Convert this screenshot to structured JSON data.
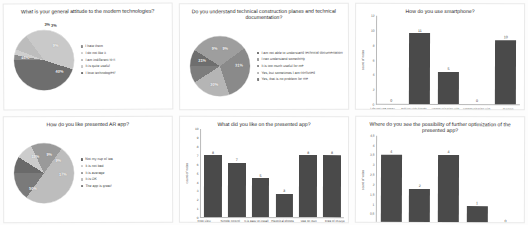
{
  "charts": [
    {
      "id": "attitude-pie",
      "title": "What is your general  attitude to the modern technologies?",
      "type": "pie",
      "labels": [
        "I hate them",
        "I do not like it",
        "I am indifferent to it",
        "It is quite useful",
        "I love technologies!"
      ],
      "values": [
        3,
        3,
        9,
        40,
        45
      ],
      "value_labels": [
        "3%",
        "3%",
        "9%",
        "40%",
        "45%"
      ],
      "colors": [
        "#8c8c8c",
        "#cfcfcf",
        "#bdbdbd",
        "#c9c9c9",
        "#6e6e6e"
      ]
    },
    {
      "id": "understand-pie",
      "title": "Do you understand technical construction planes and technical documentation?",
      "type": "pie",
      "labels": [
        "I am not able to understand technical documentation",
        "I can understand something",
        "It is too much useful for me",
        "Yes, but sometimes I am confused",
        "Yes, that is no problem for me"
      ],
      "values": [
        9,
        31,
        30,
        21,
        9
      ],
      "value_labels": [
        "9%",
        "31%",
        "30%",
        "21%",
        "9%"
      ],
      "colors": [
        "#6e6e6e",
        "#9e9e9e",
        "#8a8a8a",
        "#b5b5b5",
        "#7d7d7d"
      ]
    },
    {
      "id": "smartphone-bar",
      "title": "How do you use smartphone?",
      "type": "bar",
      "ylabel": "count of votes",
      "yticks": [
        "12",
        "10",
        "8",
        "6",
        "4",
        "2",
        "0"
      ],
      "ymax": 12,
      "categories": [
        "I do not use smart functions in smartphone at all",
        "Talking with friends and family, social networks",
        "Communication with bank/insurance company",
        "Communication with public authorities",
        "Gaming"
      ],
      "values": [
        0,
        11,
        5,
        0,
        10
      ],
      "value_labels": [
        "0",
        "11",
        "5",
        "0",
        "10"
      ]
    },
    {
      "id": "like-ar-pie",
      "title": "How do you like presented AR app?",
      "type": "pie",
      "labels": [
        "Not my cup of tea",
        "It is not bad",
        "It is average",
        "It is OK",
        "The app is great!"
      ],
      "values": [
        9,
        9,
        17,
        50,
        15
      ],
      "value_labels": [
        "9%",
        "9%",
        "17%",
        "50%",
        "15%"
      ],
      "colors": [
        "#6a6a6a",
        "#cccccc",
        "#9a9a9a",
        "#bdbdbd",
        "#7a7a7a"
      ]
    },
    {
      "id": "liked-bar",
      "title": "What did you like on the presented app?",
      "type": "bar",
      "ylabel": "count of votes",
      "yticks": [
        "10",
        "9",
        "8",
        "7",
        "6",
        "5",
        "4",
        "3",
        "2",
        "1",
        "0"
      ],
      "ymax": 10,
      "categories": [
        "Free view",
        "Simple control",
        "It is easy to install",
        "Historical photos",
        "Use on own mobile phone",
        "Free of charge"
      ],
      "values": [
        8,
        7,
        5,
        3,
        8,
        8
      ],
      "value_labels": [
        "8",
        "7",
        "5",
        "3",
        "8",
        "8"
      ]
    },
    {
      "id": "optimization-bar",
      "title": "Where do you see the possibility of further optimization of the presented app?",
      "type": "bar",
      "ylabel": "count of votes",
      "yticks": [
        "4,5",
        "4",
        "3,5",
        "3",
        "2,5",
        "2",
        "1,5",
        "1",
        "0,5",
        "0"
      ],
      "ymax": 4.5,
      "categories": [
        "Use it for urban planning visualisation",
        "Use it to work on construction processes",
        "Add more historical photos and places",
        "Make the application handsfree",
        "Make a PC version of the app"
      ],
      "values": [
        4,
        2,
        4,
        1,
        0
      ],
      "value_labels": [
        "4",
        "2",
        "4",
        "1",
        "0"
      ]
    }
  ]
}
